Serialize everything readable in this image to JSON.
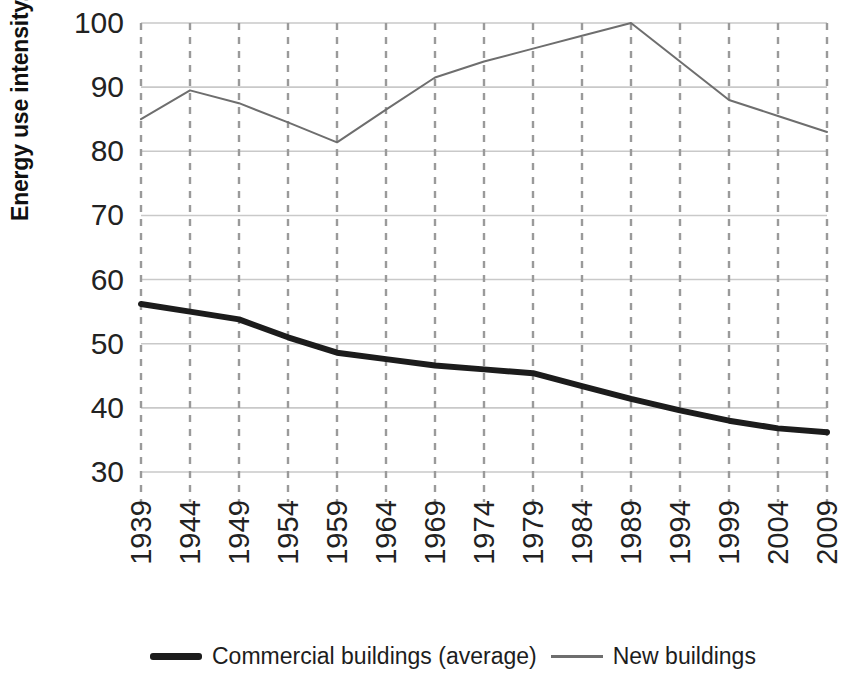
{
  "chart_data": {
    "type": "line",
    "title": "",
    "xlabel": "",
    "ylabel": "Energy use intensity, KBtu/square foot",
    "x": [
      1939,
      1944,
      1949,
      1954,
      1959,
      1964,
      1969,
      1974,
      1979,
      1984,
      1989,
      1994,
      1999,
      2004,
      2009
    ],
    "categories": [
      "1939",
      "1944",
      "1949",
      "1954",
      "1959",
      "1964",
      "1969",
      "1974",
      "1979",
      "1984",
      "1989",
      "1994",
      "1999",
      "2004",
      "2009"
    ],
    "xlim": [
      1939,
      2009
    ],
    "ylim": [
      30,
      100
    ],
    "yticks": [
      30,
      40,
      50,
      60,
      70,
      80,
      90,
      100
    ],
    "ytick_labels": [
      "30",
      "40",
      "50",
      "60",
      "70",
      "80",
      "90",
      "100"
    ],
    "grid": "both-axes-dashed-vertical-solid-horizontal",
    "legend_position": "bottom",
    "series": [
      {
        "name": "Pre-retrofit building stock",
        "style": "thin",
        "color": "#6e6e6e",
        "width_px": 2,
        "values": [
          85.0,
          89.5,
          87.5,
          84.5,
          81.4,
          86.5,
          91.5,
          94.0,
          96.0,
          98.0,
          100.0,
          94.0,
          88.0,
          85.5,
          83.0
        ]
      },
      {
        "name": "New construction energy code",
        "style": "thick",
        "color": "#1c1c1c",
        "width_px": 6,
        "values": [
          56.2,
          55.0,
          53.8,
          51.0,
          48.6,
          47.6,
          46.6,
          46.0,
          45.4,
          43.4,
          41.4,
          39.6,
          38.0,
          36.8,
          36.2
        ]
      }
    ]
  },
  "legend": {
    "entries": [
      {
        "label": "Commercial buildings (average)",
        "swatch": "thick"
      },
      {
        "label": "New buildings",
        "swatch": "thin"
      }
    ]
  }
}
